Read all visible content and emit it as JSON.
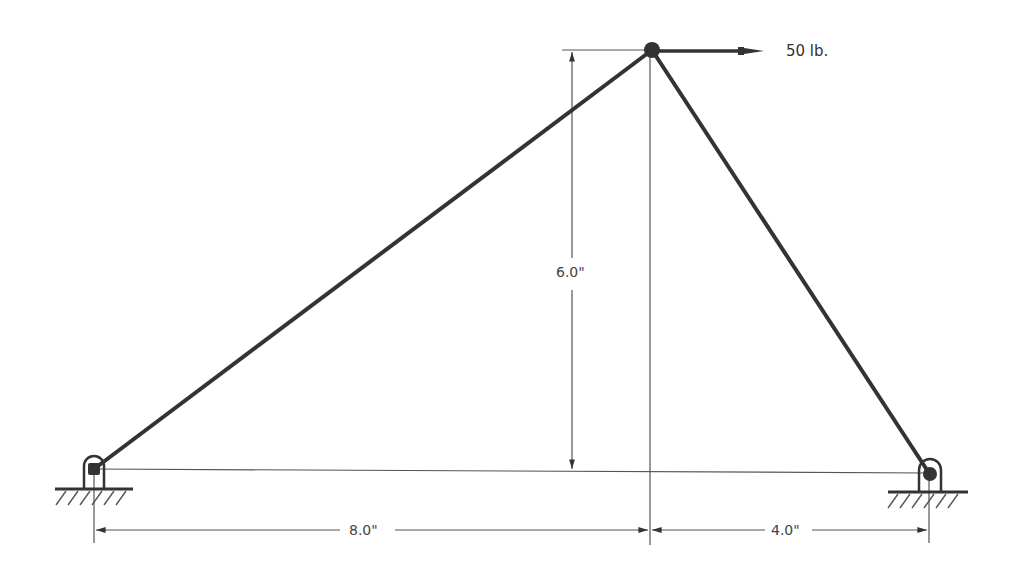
{
  "diagram": {
    "type": "truss-statics",
    "force": {
      "label": "50 lb.",
      "direction": "right",
      "magnitude": 50,
      "unit": "lb"
    },
    "dimensions": {
      "height": {
        "label": "6.0\"",
        "value": 6.0
      },
      "left_span": {
        "label": "8.0\"",
        "value": 8.0
      },
      "right_span": {
        "label": "4.0\"",
        "value": 4.0
      }
    },
    "supports": [
      {
        "name": "left-pin",
        "type": "pin"
      },
      {
        "name": "right-pin",
        "type": "pin"
      }
    ],
    "members": [
      {
        "name": "left-member",
        "from": "left-pin",
        "to": "top-joint"
      },
      {
        "name": "right-member",
        "from": "right-pin",
        "to": "top-joint"
      }
    ],
    "colors": {
      "member": "#333333",
      "dimension": "#555555",
      "background": "#ffffff"
    }
  }
}
